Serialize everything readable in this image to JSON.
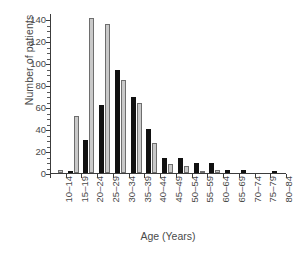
{
  "chart_data": {
    "type": "bar",
    "title": "",
    "xlabel": "Age (Years)",
    "ylabel": "Number of patients",
    "categories": [
      "10–14",
      "15–19",
      "20–24",
      "25–29",
      "30–34",
      "35–39",
      "40–44",
      "45–49",
      "50–54",
      "55–59",
      "60–64",
      "65–69",
      "70–74",
      "75–79",
      "80–84"
    ],
    "series": [
      {
        "name": "dark",
        "color": "#111111",
        "values": [
          0,
          1,
          30,
          62,
          94,
          69,
          40,
          14,
          14,
          9,
          9,
          3,
          3,
          0,
          2
        ]
      },
      {
        "name": "light",
        "color": "#c9c9c9",
        "values": [
          3,
          52,
          141,
          136,
          85,
          64,
          27,
          8,
          6,
          2,
          3,
          0,
          0,
          0,
          0
        ]
      }
    ],
    "ylim": [
      0,
      145
    ],
    "yticks": [
      0,
      20,
      40,
      60,
      80,
      100,
      120,
      140
    ],
    "ytick_labels": [
      "0",
      "20",
      "40",
      "60",
      "80",
      "100",
      "120",
      "140"
    ],
    "yminor_step": 5,
    "grid": false,
    "legend": "none",
    "axis_color": "#3c3c3c"
  }
}
